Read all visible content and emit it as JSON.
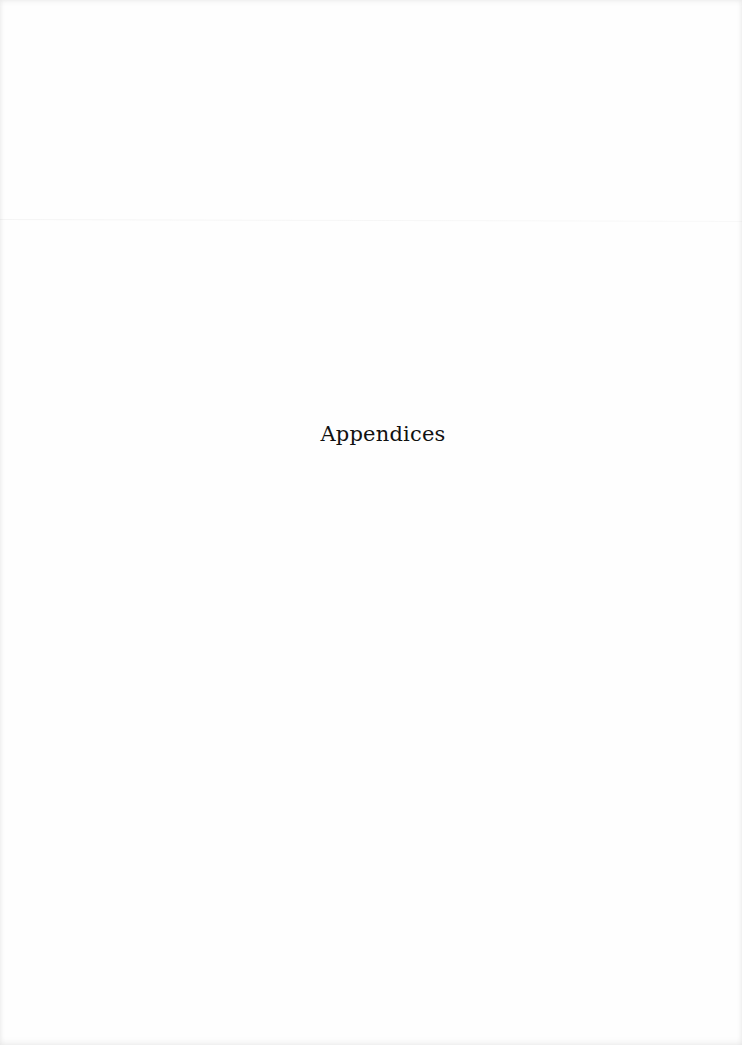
{
  "document": {
    "heading": "Appendices"
  },
  "colors": {
    "page_background": "#fefefe",
    "text": "#111111"
  }
}
